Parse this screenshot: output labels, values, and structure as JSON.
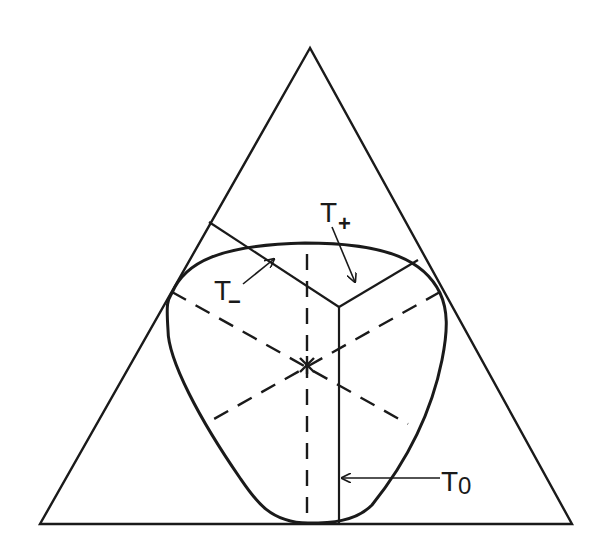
{
  "diagram": {
    "labels": {
      "t_plus": {
        "main": "T",
        "sub": "+"
      },
      "t_minus": {
        "main": "T",
        "sub": "−"
      },
      "t_zero": {
        "main": "T",
        "sub": "0"
      }
    },
    "colors": {
      "ink": "#1a1a1a",
      "background": "#ffffff"
    },
    "elements": [
      "equilateral-triangle",
      "closed-curve",
      "three-dashed-symmetry-axes",
      "center-point",
      "solid-y-junction-lines",
      "arrows-to-T+",
      "arrows-to-T-",
      "arrow-to-T0"
    ]
  }
}
